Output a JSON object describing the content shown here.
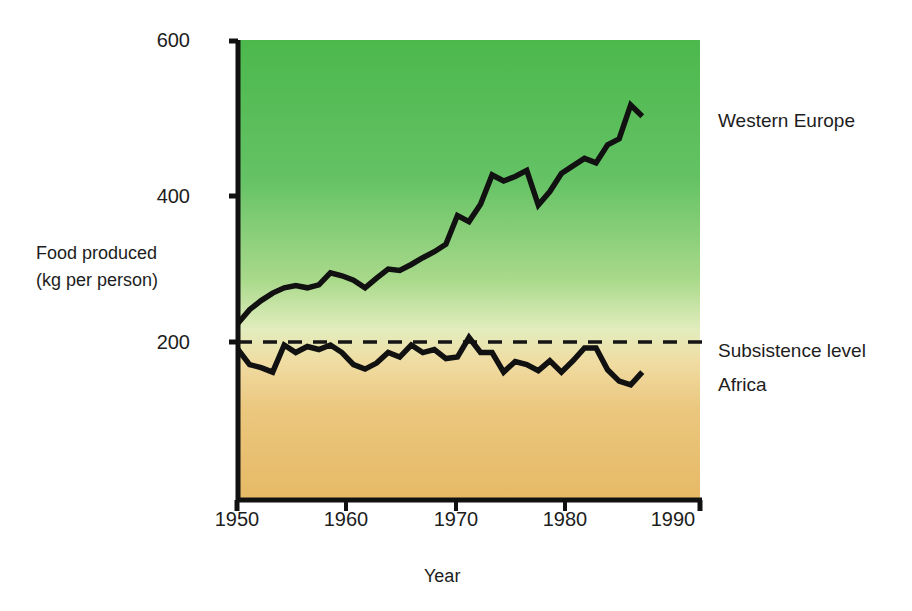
{
  "chart_data": {
    "type": "line",
    "title": "",
    "xlabel": "Year",
    "ylabel": "Food produced\n(kg per person)",
    "ylabel_line1": "Food produced",
    "ylabel_line2": "(kg per person)",
    "xlim": [
      1950,
      1990
    ],
    "ylim": [
      0,
      600
    ],
    "xticks": [
      1950,
      1960,
      1970,
      1980,
      1990
    ],
    "xtick_labels": [
      "1950",
      "1960",
      "1970",
      "1980",
      "1990"
    ],
    "yticks": [
      200,
      400,
      600
    ],
    "ytick_labels": [
      "200",
      "400",
      "600"
    ],
    "grid": false,
    "legend_position": "right-inline-annotations",
    "background": "vertical gradient from green (high food production) at top to tan/orange (low) at bottom",
    "colors": {
      "gradient_top": "#4cb84c",
      "gradient_mid": "#eaf2c8",
      "gradient_bottom": "#e8bc70",
      "line": "#111111",
      "axis": "#111111",
      "text": "#1d1d1d"
    },
    "annotations": [
      {
        "text": "Western Europe",
        "x": 1992,
        "y": 500
      },
      {
        "text": "Subsistence level",
        "x": 1992,
        "y": 200
      },
      {
        "text": "Africa",
        "x": 1992,
        "y": 155
      }
    ],
    "reference_line": {
      "label": "Subsistence level",
      "value": 200,
      "style": "dashed",
      "x_start": 1950,
      "x_end": 1990
    },
    "series": [
      {
        "name": "Western Europe",
        "style": "solid",
        "x": [
          1950,
          1951,
          1952,
          1953,
          1954,
          1955,
          1956,
          1957,
          1958,
          1959,
          1960,
          1961,
          1962,
          1963,
          1964,
          1965,
          1966,
          1967,
          1968,
          1969,
          1970,
          1971,
          1972,
          1973,
          1974,
          1975,
          1976,
          1977,
          1978,
          1979,
          1980,
          1981,
          1982,
          1983,
          1984,
          1985
        ],
        "values": [
          225,
          243,
          255,
          265,
          272,
          275,
          272,
          276,
          292,
          288,
          282,
          272,
          285,
          297,
          295,
          303,
          312,
          320,
          330,
          368,
          360,
          383,
          422,
          414,
          420,
          428,
          382,
          400,
          424,
          434,
          444,
          438,
          462,
          470,
          515,
          500
        ]
      },
      {
        "name": "Africa",
        "style": "solid",
        "x": [
          1950,
          1951,
          1952,
          1953,
          1954,
          1955,
          1956,
          1957,
          1958,
          1959,
          1960,
          1961,
          1962,
          1963,
          1964,
          1965,
          1966,
          1967,
          1968,
          1969,
          1970,
          1971,
          1972,
          1973,
          1974,
          1975,
          1976,
          1977,
          1978,
          1979,
          1980,
          1981,
          1982,
          1983,
          1984,
          1985
        ],
        "values": [
          190,
          170,
          166,
          160,
          196,
          186,
          194,
          190,
          196,
          186,
          170,
          164,
          172,
          186,
          180,
          196,
          186,
          190,
          178,
          180,
          206,
          186,
          186,
          160,
          174,
          170,
          162,
          175,
          160,
          175,
          192,
          192,
          163,
          148,
          143,
          160
        ]
      }
    ]
  },
  "labels": {
    "y_axis_line1": "Food produced",
    "y_axis_line2": "(kg per person)",
    "x_axis": "Year",
    "western_europe": "Western Europe",
    "subsistence_level": "Subsistence level",
    "africa": "Africa",
    "y_600": "600",
    "y_400": "400",
    "y_200": "200",
    "x_1950": "1950",
    "x_1960": "1960",
    "x_1970": "1970",
    "x_1980": "1980",
    "x_1990": "1990"
  }
}
